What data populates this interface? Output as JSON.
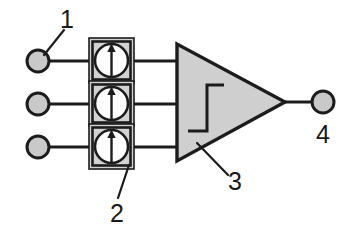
{
  "figure": {
    "background_color": "#ffffff",
    "line_color": "#1c1c1c",
    "fill_gray": "#c9c9c9",
    "fill_light_gray": "#d2d2d2",
    "fill_white": "#fefefe"
  },
  "reference_numerals": [
    {
      "id": "1",
      "label": "1",
      "points_to": "input-terminal-top",
      "x": 67,
      "y": 26
    },
    {
      "id": "2",
      "label": "2",
      "points_to": "sensor-box-bottom",
      "x": 115,
      "y": 213
    },
    {
      "id": "3",
      "label": "3",
      "points_to": "amplifier-triangle",
      "x": 232,
      "y": 183
    },
    {
      "id": "4",
      "label": "4",
      "points_to": "output-terminal",
      "x": 323,
      "y": 138
    }
  ],
  "input_terminals": [
    {
      "name": "input-terminal-top",
      "cx": 38,
      "cy": 61,
      "r": 11,
      "fill": "#c9c9c9"
    },
    {
      "name": "input-terminal-middle",
      "cx": 38,
      "cy": 104,
      "r": 11,
      "fill": "#c9c9c9"
    },
    {
      "name": "input-terminal-bottom",
      "cx": 38,
      "cy": 147,
      "r": 11,
      "fill": "#c9c9c9"
    }
  ],
  "sensor_boxes": [
    {
      "name": "sensor-box-top",
      "x": 88,
      "y": 31,
      "size": 46,
      "symbol": "circle-with-up-arrow"
    },
    {
      "name": "sensor-box-middle",
      "x": 88,
      "y": 81,
      "size": 46,
      "symbol": "circle-with-up-arrow"
    },
    {
      "name": "sensor-box-bottom",
      "x": 88,
      "y": 128,
      "size": 46,
      "symbol": "circle-with-up-arrow"
    }
  ],
  "amplifier": {
    "name": "amplifier-triangle",
    "apex_top": [
      177,
      45
    ],
    "apex_bottom": [
      177,
      160
    ],
    "tip": [
      284,
      102
    ],
    "fill": "#cfcfcf",
    "inner_symbol": "step-threshold-schmitt-trigger"
  },
  "output_terminal": {
    "name": "output-terminal",
    "cx": 323,
    "cy": 102,
    "r": 11,
    "fill": "#c9c9c9"
  },
  "wires": [
    {
      "name": "wire-input-top",
      "from": [
        49,
        61
      ],
      "to": [
        88,
        61
      ]
    },
    {
      "name": "wire-input-middle",
      "from": [
        49,
        104
      ],
      "to": [
        88,
        104
      ]
    },
    {
      "name": "wire-input-bottom",
      "from": [
        49,
        147
      ],
      "to": [
        88,
        147
      ]
    },
    {
      "name": "wire-sensor-top-to-amp",
      "from": [
        134,
        61
      ],
      "to": [
        178,
        61
      ]
    },
    {
      "name": "wire-sensor-middle-to-amp",
      "from": [
        134,
        104
      ],
      "to": [
        178,
        104
      ]
    },
    {
      "name": "wire-sensor-bottom-to-amp",
      "from": [
        134,
        147
      ],
      "to": [
        178,
        147
      ]
    },
    {
      "name": "wire-amp-to-output",
      "from": [
        284,
        102
      ],
      "to": [
        312,
        102
      ]
    }
  ],
  "leader_lines": [
    {
      "name": "leader-line-1",
      "from": [
        63,
        32
      ],
      "to": [
        44,
        55
      ]
    },
    {
      "name": "leader-line-2",
      "from": [
        117,
        196
      ],
      "to": [
        128,
        168
      ]
    },
    {
      "name": "leader-line-3",
      "from": [
        227,
        174
      ],
      "to": [
        198,
        144
      ]
    },
    {
      "name": "leader-line-4",
      "from": [
        323,
        120
      ],
      "to": [
        323,
        120
      ]
    }
  ]
}
